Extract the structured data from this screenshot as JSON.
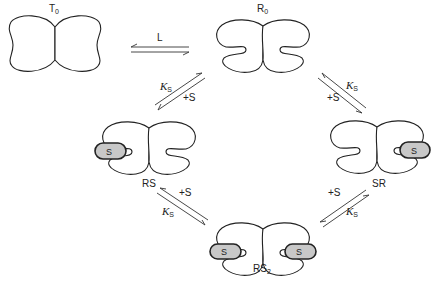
{
  "diagram": {
    "type": "allosteric-binding-scheme",
    "states": {
      "T0": {
        "label": "T",
        "sub": "0",
        "description": "tense state, no ligand"
      },
      "R0": {
        "label": "R",
        "sub": "0",
        "description": "relaxed state, no substrate"
      },
      "RS": {
        "label": "RS",
        "sub": "",
        "description": "relaxed state, substrate bound on left"
      },
      "SR": {
        "label": "SR",
        "sub": "",
        "description": "relaxed state, substrate bound on right"
      },
      "RS2": {
        "label": "RS",
        "sub": "2",
        "description": "relaxed state, substrate bound on both sites"
      }
    },
    "substrate_label": "S",
    "equilibria": [
      {
        "from": "T0",
        "to": "R0",
        "label": "L"
      },
      {
        "from": "R0",
        "to": "RS",
        "forward_label": "+S",
        "constant": "K",
        "constant_sub": "S"
      },
      {
        "from": "R0",
        "to": "SR",
        "forward_label": "+S",
        "constant": "K",
        "constant_sub": "S"
      },
      {
        "from": "RS",
        "to": "RS2",
        "forward_label": "+S",
        "constant": "K",
        "constant_sub": "S"
      },
      {
        "from": "SR",
        "to": "RS2",
        "forward_label": "+S",
        "constant": "K",
        "constant_sub": "S"
      }
    ],
    "labels": {
      "L": "L",
      "plus_s": "+S",
      "k": "K",
      "k_sub": "S",
      "S": "S"
    }
  }
}
